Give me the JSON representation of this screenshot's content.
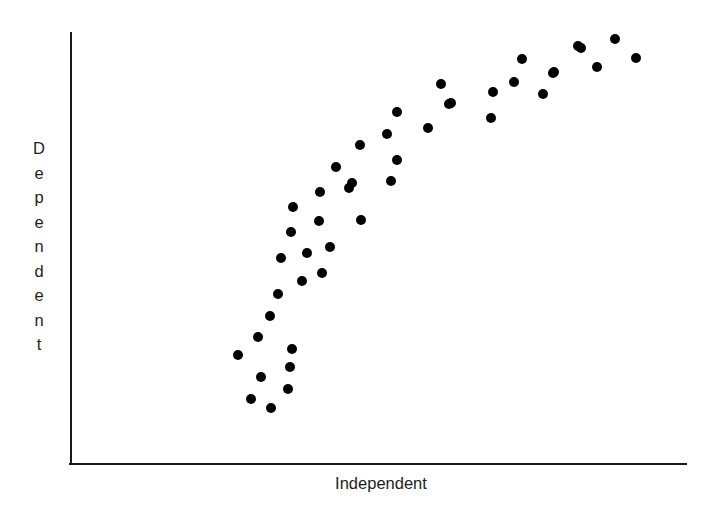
{
  "chart_data": {
    "type": "scatter",
    "title": "",
    "xlabel": "Independent",
    "ylabel": "Dependent",
    "grid": false,
    "legend": null,
    "axes": {
      "x_axis_visible": true,
      "y_axis_visible": true,
      "x_ticks": [],
      "y_ticks": [],
      "xlim": [
        0,
        100
      ],
      "ylim": [
        0,
        100
      ],
      "note": "Axes are unlabeled; values below are normalized 0-100 read off the plot box."
    },
    "marker": {
      "shape": "circle",
      "color": "#000000",
      "radius_px": 5
    },
    "points": [
      {
        "x": 26.6,
        "y": 21.2
      },
      {
        "x": 29.2,
        "y": 13.3
      },
      {
        "x": 32.0,
        "y": 25.0
      },
      {
        "x": 34.9,
        "y": 9.3
      },
      {
        "x": 35.1,
        "y": 32.1
      },
      {
        "x": 35.4,
        "y": 17.7
      },
      {
        "x": 36.4,
        "y": 27.2
      },
      {
        "x": 30.6,
        "y": 30.4
      },
      {
        "x": 35.1,
        "y": 39.8
      },
      {
        "x": 33.7,
        "y": 45.1
      },
      {
        "x": 37.9,
        "y": 22.6
      },
      {
        "x": 38.9,
        "y": 35.0
      },
      {
        "x": 41.4,
        "y": 42.2
      },
      {
        "x": 36.2,
        "y": 51.3
      },
      {
        "x": 40.8,
        "y": 47.3
      },
      {
        "x": 43.6,
        "y": 53.7
      },
      {
        "x": 43.4,
        "y": 62.1
      },
      {
        "x": 46.4,
        "y": 58.0
      },
      {
        "x": 47.8,
        "y": 67.1
      },
      {
        "x": 51.1,
        "y": 61.5
      },
      {
        "x": 50.5,
        "y": 52.2
      },
      {
        "x": 53.4,
        "y": 72.6
      },
      {
        "x": 55.8,
        "y": 77.0
      },
      {
        "x": 51.7,
        "y": 69.1
      },
      {
        "x": 57.6,
        "y": 66.6
      },
      {
        "x": 58.4,
        "y": 82.2
      },
      {
        "x": 61.1,
        "y": 77.5
      },
      {
        "x": 62.7,
        "y": 86.5
      },
      {
        "x": 65.6,
        "y": 80.6
      },
      {
        "x": 68.2,
        "y": 89.4
      },
      {
        "x": 71.3,
        "y": 83.8
      },
      {
        "x": 74.6,
        "y": 86.7
      },
      {
        "x": 77.9,
        "y": 92.2
      },
      {
        "x": 80.4,
        "y": 88.4
      },
      {
        "x": 83.0,
        "y": 94.3
      },
      {
        "x": 85.9,
        "y": 90.2
      },
      {
        "x": 88.8,
        "y": 96.6
      },
      {
        "x": 91.8,
        "y": 92.7
      },
      {
        "x": 94.9,
        "y": 97.9
      },
      {
        "x": 97.1,
        "y": 93.5
      }
    ],
    "points_px": [
      {
        "cx": 238,
        "cy": 355
      },
      {
        "cx": 258,
        "cy": 337
      },
      {
        "cx": 251,
        "cy": 399
      },
      {
        "cx": 261,
        "cy": 377
      },
      {
        "cx": 271,
        "cy": 408
      },
      {
        "cx": 270,
        "cy": 316
      },
      {
        "cx": 281,
        "cy": 258
      },
      {
        "cx": 278,
        "cy": 294
      },
      {
        "cx": 290,
        "cy": 367
      },
      {
        "cx": 288,
        "cy": 389
      },
      {
        "cx": 292,
        "cy": 349
      },
      {
        "cx": 291,
        "cy": 232
      },
      {
        "cx": 293,
        "cy": 207
      },
      {
        "cx": 302,
        "cy": 281
      },
      {
        "cx": 307,
        "cy": 253
      },
      {
        "cx": 319,
        "cy": 221
      },
      {
        "cx": 320,
        "cy": 192
      },
      {
        "cx": 322,
        "cy": 273
      },
      {
        "cx": 330,
        "cy": 247
      },
      {
        "cx": 336,
        "cy": 167
      },
      {
        "cx": 349,
        "cy": 188
      },
      {
        "cx": 361,
        "cy": 220
      },
      {
        "cx": 360,
        "cy": 145
      },
      {
        "cx": 352,
        "cy": 183
      },
      {
        "cx": 391,
        "cy": 181
      },
      {
        "cx": 397,
        "cy": 160
      },
      {
        "cx": 387,
        "cy": 134
      },
      {
        "cx": 397,
        "cy": 112
      },
      {
        "cx": 428,
        "cy": 128
      },
      {
        "cx": 441,
        "cy": 84
      },
      {
        "cx": 451,
        "cy": 103
      },
      {
        "cx": 449,
        "cy": 104
      },
      {
        "cx": 491,
        "cy": 118
      },
      {
        "cx": 493,
        "cy": 92
      },
      {
        "cx": 514,
        "cy": 82
      },
      {
        "cx": 522,
        "cy": 59
      },
      {
        "cx": 543,
        "cy": 94
      },
      {
        "cx": 553,
        "cy": 73
      },
      {
        "cx": 554,
        "cy": 72
      },
      {
        "cx": 578,
        "cy": 46
      },
      {
        "cx": 581,
        "cy": 48
      },
      {
        "cx": 597,
        "cy": 67
      },
      {
        "cx": 615,
        "cy": 39
      },
      {
        "cx": 636,
        "cy": 58
      }
    ]
  },
  "colors": {
    "marker": "#000000",
    "axis": "#1a1a1a",
    "text": "#1d1d1d",
    "background": "#ffffff"
  },
  "labels": {
    "x_axis": "Independent",
    "y_axis_letters": [
      "D",
      "e",
      "p",
      "e",
      "n",
      "d",
      "e",
      "n",
      "t"
    ]
  }
}
